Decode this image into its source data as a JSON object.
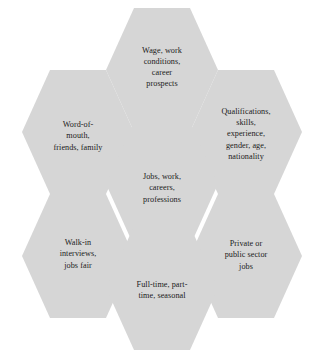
{
  "diagram": {
    "type": "honeycomb-hexagon-cluster",
    "title": "Jobs, work, careers, professions",
    "fill_color": "#d6d6d6",
    "text_color": "#1b1b1b",
    "background_color": "#ffffff",
    "nodes": [
      {
        "id": "center",
        "role": "center",
        "position": "center",
        "label": "Jobs, work,\ncareers,\nprofessions"
      },
      {
        "id": "wage",
        "role": "satellite",
        "position": "top",
        "label": "Wage, work\nconditions,\ncareer\nprospects"
      },
      {
        "id": "qualifications",
        "role": "satellite",
        "position": "top-right",
        "label": "Qualifications,\nskills,\nexperience,\ngender, age,\nnationality"
      },
      {
        "id": "sector",
        "role": "satellite",
        "position": "bottom-right",
        "label": "Private or\npublic sector\njobs"
      },
      {
        "id": "hours",
        "role": "satellite",
        "position": "bottom",
        "label": "Full-time, part-\ntime, seasonal"
      },
      {
        "id": "walkin",
        "role": "satellite",
        "position": "bottom-left",
        "label": "Walk-in\ninterviews,\njobs fair"
      },
      {
        "id": "wordofmouth",
        "role": "satellite",
        "position": "top-left",
        "label": "Word-of-\nmouth,\nfriends, family"
      }
    ]
  }
}
